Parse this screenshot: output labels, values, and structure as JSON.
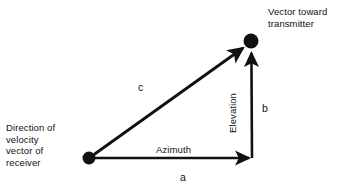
{
  "figure": {
    "background_color": "#ffffff",
    "stroke_color": "#111111",
    "labels": {
      "transmitter_line1": "Vector toward",
      "transmitter_line2": "transmitter",
      "receiver_line1": "Direction of",
      "receiver_line2": "velocity",
      "receiver_line3": "vector of",
      "receiver_line4": "receiver",
      "azimuth": "Azimuth",
      "elevation": "Elevation",
      "side_a": "a",
      "side_b": "b",
      "side_c": "c"
    },
    "nodes": [
      {
        "name": "receiver-vertex",
        "x": 89,
        "y": 158,
        "radius": 6.5
      },
      {
        "name": "transmitter-vertex",
        "x": 251,
        "y": 41,
        "radius": 7.5
      }
    ],
    "edges": [
      {
        "name": "azimuth-edge",
        "label": "Azimuth",
        "measure": "a",
        "from": [
          89,
          158
        ],
        "to": [
          252,
          158
        ],
        "arrow": true
      },
      {
        "name": "elevation-edge",
        "label": "Elevation",
        "measure": "b",
        "from": [
          252,
          158
        ],
        "to": [
          251,
          50
        ],
        "arrow": true
      },
      {
        "name": "line-of-sight-edge",
        "label": "",
        "measure": "c",
        "from": [
          95,
          154
        ],
        "to": [
          245,
          47
        ],
        "arrow": true
      }
    ]
  }
}
